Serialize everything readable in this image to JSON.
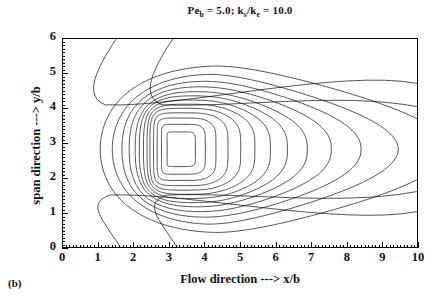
{
  "panel": {
    "label": "(b)"
  },
  "title": {
    "pe_symbol": "Pe",
    "pe_subscript": "b",
    "pe_value": "= 5.0;",
    "k_num": "k",
    "k_num_subscript": "s",
    "k_slash": "/k",
    "k_den_subscript": "e",
    "k_value": "= 10.0",
    "full_text": "Pe_b = 5.0; k_s/k_e = 10.0"
  },
  "axes": {
    "x_caption": "Flow direction ---> x/b",
    "y_caption": "span direction ---> y/b",
    "x_ticks": [
      "0",
      "1",
      "2",
      "3",
      "4",
      "5",
      "6",
      "7",
      "8",
      "9",
      "10"
    ],
    "y_ticks": [
      "0",
      "1",
      "2",
      "3",
      "4",
      "5",
      "6"
    ]
  },
  "chart_data": {
    "type": "line",
    "subtype": "contour",
    "xlabel": "Flow direction ---> x/b",
    "ylabel": "span direction ---> y/b",
    "xlim": [
      0,
      10
    ],
    "ylim": [
      0,
      6
    ],
    "xticks": [
      0,
      1,
      2,
      3,
      4,
      5,
      6,
      7,
      8,
      9,
      10
    ],
    "yticks": [
      0,
      1,
      2,
      3,
      4,
      5,
      6
    ],
    "x_minor_tick_step": 0.1,
    "y_minor_tick_step": 0.1,
    "grid": false,
    "legend": "none",
    "line_color": "#000000",
    "background": "#ffffff",
    "contour_center": [
      3.3,
      2.8
    ],
    "n_contours": 15,
    "contours": [
      {
        "level": 1,
        "closed": true,
        "rx": 0.42,
        "ry": 0.5,
        "cx": 3.32,
        "cy": 2.82,
        "squareness": 0.72,
        "tail": 0.0
      },
      {
        "level": 2,
        "closed": true,
        "rx": 0.62,
        "ry": 0.72,
        "cx": 3.34,
        "cy": 2.82,
        "squareness": 0.55,
        "tail": 0.06
      },
      {
        "level": 3,
        "closed": true,
        "rx": 0.8,
        "ry": 0.9,
        "cx": 3.38,
        "cy": 2.82,
        "squareness": 0.42,
        "tail": 0.14
      },
      {
        "level": 4,
        "closed": true,
        "rx": 0.98,
        "ry": 1.05,
        "cx": 3.44,
        "cy": 2.82,
        "squareness": 0.32,
        "tail": 0.24
      },
      {
        "level": 5,
        "closed": true,
        "rx": 1.16,
        "ry": 1.18,
        "cx": 3.5,
        "cy": 2.82,
        "squareness": 0.24,
        "tail": 0.36
      },
      {
        "level": 6,
        "closed": true,
        "rx": 1.34,
        "ry": 1.3,
        "cx": 3.58,
        "cy": 2.82,
        "squareness": 0.18,
        "tail": 0.5
      },
      {
        "level": 7,
        "closed": true,
        "rx": 1.54,
        "ry": 1.42,
        "cx": 3.66,
        "cy": 2.82,
        "squareness": 0.13,
        "tail": 0.66
      },
      {
        "level": 8,
        "closed": true,
        "rx": 1.76,
        "ry": 1.54,
        "cx": 3.74,
        "cy": 2.82,
        "squareness": 0.09,
        "tail": 0.84
      },
      {
        "level": 9,
        "closed": true,
        "rx": 2.0,
        "ry": 1.66,
        "cx": 3.84,
        "cy": 2.82,
        "squareness": 0.06,
        "tail": 1.06
      },
      {
        "level": 10,
        "closed": true,
        "rx": 2.3,
        "ry": 1.8,
        "cx": 3.94,
        "cy": 2.82,
        "squareness": 0.04,
        "tail": 1.34
      },
      {
        "level": 11,
        "closed": true,
        "rx": 2.66,
        "ry": 1.96,
        "cx": 4.06,
        "cy": 2.82,
        "squareness": 0.02,
        "tail": 1.7
      },
      {
        "level": 12,
        "closed": true,
        "rx": 3.12,
        "ry": 2.16,
        "cx": 4.2,
        "cy": 2.82,
        "squareness": 0.0,
        "tail": 2.15
      },
      {
        "level": 13,
        "closed": true,
        "rx": 3.72,
        "ry": 2.4,
        "cx": 4.4,
        "cy": 2.82,
        "squareness": 0.0,
        "tail": 2.75
      },
      {
        "level": 14,
        "open": true,
        "enters": "top x=3.10",
        "exits": "bottom x=3.22",
        "right_y": [
          4.05,
          1.6
        ]
      },
      {
        "level": 15,
        "open": true,
        "enters": "top x=1.50",
        "exits": "bottom x=1.62",
        "right_y": [
          4.72,
          1.02
        ]
      }
    ]
  }
}
